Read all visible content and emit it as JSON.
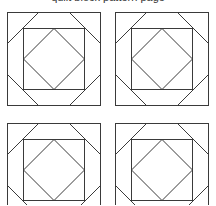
{
  "caption": {
    "text": "quilt block pattern page"
  },
  "diagram": {
    "type": "quilt-block-grid",
    "stroke_color": "#3a3a3a",
    "background": "#ffffff",
    "rows": 2,
    "columns": 2,
    "block": {
      "outer_size": 93,
      "inner_inset": 16,
      "inner_size": 62,
      "corner_cut": 31,
      "elements": [
        "outer-square",
        "inner-square",
        "inner-diamond",
        "corner-diagonals"
      ]
    },
    "blocks": [
      {
        "id": "top-left",
        "x": 7,
        "y": 12
      },
      {
        "id": "top-right",
        "x": 115,
        "y": 12
      },
      {
        "id": "bottom-left",
        "x": 7,
        "y": 123
      },
      {
        "id": "bottom-right",
        "x": 115,
        "y": 123
      }
    ]
  }
}
